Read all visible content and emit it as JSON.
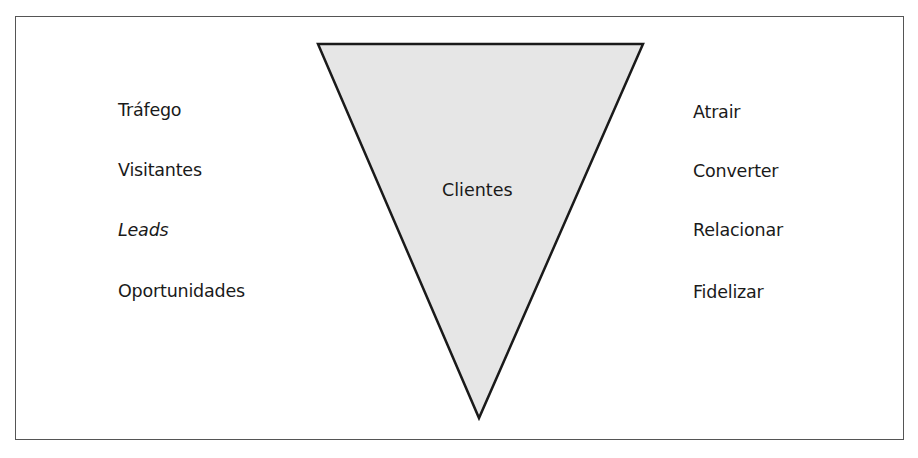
{
  "diagram": {
    "type": "inverted-funnel",
    "center_label": "Clientes",
    "fill_color": "#e6e6e6",
    "stroke_color": "#1a1a1a",
    "left_labels": [
      {
        "text": "Tráfego",
        "italic": false
      },
      {
        "text": "Visitantes",
        "italic": false
      },
      {
        "text": "Leads",
        "italic": true
      },
      {
        "text": "Oportunidades",
        "italic": false
      }
    ],
    "right_labels": [
      {
        "text": "Atrair"
      },
      {
        "text": "Converter"
      },
      {
        "text": "Relacionar"
      },
      {
        "text": "Fidelizar"
      }
    ]
  }
}
